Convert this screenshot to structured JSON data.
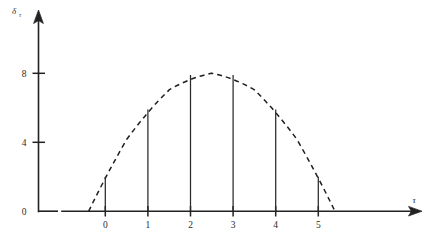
{
  "chart_data": {
    "type": "bar",
    "title": "",
    "subtitle": "",
    "xlabel": "τ",
    "ylabel": "δ",
    "ylabel_sub": "τ",
    "categories": [
      "0",
      "1",
      "2",
      "3",
      "4",
      "5"
    ],
    "x": [
      0,
      1,
      2,
      3,
      4,
      5
    ],
    "values": [
      2.0,
      5.9,
      7.9,
      7.9,
      5.9,
      2.0
    ],
    "xlim": [
      -0.85,
      6.6
    ],
    "ylim": [
      0,
      11.5
    ],
    "xticks": [
      0,
      1,
      2,
      3,
      4,
      5
    ],
    "xtick_labels": [
      "0",
      "1",
      "2",
      "3",
      "4",
      "5"
    ],
    "yticks": [
      0,
      4,
      8
    ],
    "ytick_labels": [
      "0",
      "4",
      "8"
    ],
    "grid": false,
    "legend": "none",
    "series": [
      {
        "name": "stems",
        "style": "vertical-lines",
        "values": [
          2.0,
          5.9,
          7.9,
          7.9,
          5.9,
          2.0
        ]
      },
      {
        "name": "envelope",
        "style": "dashed-parabola",
        "vertex_x": 2.5,
        "vertex_y": 8.0,
        "coefficient": -0.96,
        "root_left": -0.39,
        "root_right": 5.39,
        "points": [
          {
            "x": -0.39,
            "y": 0.0
          },
          {
            "x": 0.0,
            "y": 2.0
          },
          {
            "x": 0.5,
            "y": 4.16
          },
          {
            "x": 1.0,
            "y": 5.84
          },
          {
            "x": 1.5,
            "y": 7.04
          },
          {
            "x": 2.0,
            "y": 7.76
          },
          {
            "x": 2.5,
            "y": 8.0
          },
          {
            "x": 3.0,
            "y": 7.76
          },
          {
            "x": 3.5,
            "y": 7.04
          },
          {
            "x": 4.0,
            "y": 5.84
          },
          {
            "x": 4.5,
            "y": 4.16
          },
          {
            "x": 5.0,
            "y": 2.0
          },
          {
            "x": 5.39,
            "y": 0.0
          }
        ]
      }
    ]
  },
  "axes": {
    "y_title": "δ",
    "y_title_sub": "τ",
    "x_title": "τ",
    "y_tick_0": "0",
    "y_tick_4": "4",
    "y_tick_8": "8",
    "x_tick_0": "0",
    "x_tick_1": "1",
    "x_tick_2": "2",
    "x_tick_3": "3",
    "x_tick_4": "4",
    "x_tick_5": "5"
  },
  "colors": {
    "ink": "#222222",
    "background": "#ffffff"
  }
}
